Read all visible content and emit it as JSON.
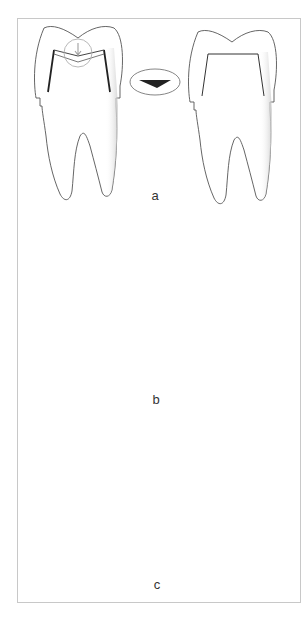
{
  "figure": {
    "type": "dental-diagram",
    "panels": [
      {
        "label": "a",
        "left_tooth": {
          "annotation": "circled-down-arrow",
          "position": "occlusal-center"
        },
        "symbol": {
          "shape": "ellipse",
          "content": "dark-wedge-triangle"
        },
        "right_tooth": {
          "state": "restored"
        }
      },
      {
        "label": "b",
        "left_tooth": {
          "annotation": "circled-right-arrow",
          "position": "cervical-left-margin"
        },
        "symbol": {
          "shape": "ellipse",
          "content": "small-dark-square"
        },
        "right_tooth": {
          "state": "restored"
        }
      },
      {
        "label": "c",
        "left_tooth": {
          "annotation": "two-circled-arrows",
          "position": "both-lateral-margins"
        },
        "symbol": {
          "shape": "ellipse",
          "content": "two-vertical-lines"
        },
        "right_tooth": {
          "state": "restored"
        }
      }
    ],
    "colors": {
      "outline": "#555555",
      "preparation_line": "#222222",
      "circle": "#b0b0b0",
      "arrow": "#a0a0a0",
      "frame": "#c8c8c8",
      "shade": "#d4d4d4"
    }
  }
}
